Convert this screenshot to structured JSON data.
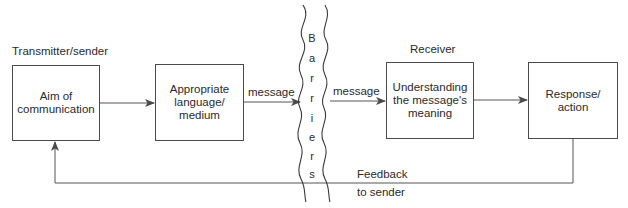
{
  "diagram": {
    "labels": {
      "sender": "Transmitter/sender",
      "receiver": "Receiver"
    },
    "boxes": [
      {
        "id": "aim",
        "text_lines": [
          "Aim of",
          "communication"
        ]
      },
      {
        "id": "medium",
        "text_lines": [
          "Appropriate",
          "language/",
          "medium"
        ]
      },
      {
        "id": "understanding",
        "text_lines": [
          "Understanding",
          "the message's",
          "meaning"
        ]
      },
      {
        "id": "response",
        "text_lines": [
          "Response/",
          "action"
        ]
      }
    ],
    "edges": [
      {
        "from": "aim",
        "to": "medium",
        "label": ""
      },
      {
        "from": "medium",
        "to": "barriers",
        "label": "message"
      },
      {
        "from": "barriers",
        "to": "understanding",
        "label": "message"
      },
      {
        "from": "understanding",
        "to": "response",
        "label": ""
      },
      {
        "from": "response",
        "to": "aim",
        "label": "Feedback to sender"
      }
    ],
    "barrier": {
      "letters": [
        "B",
        "a",
        "r",
        "r",
        "i",
        "e",
        "r",
        "s"
      ],
      "word": "Barriers"
    },
    "feedback": {
      "line1": "Feedback",
      "line2": "to sender"
    },
    "colors": {
      "line": "#4a4a4a",
      "text": "#2a2a2a",
      "background": "#ffffff"
    }
  }
}
